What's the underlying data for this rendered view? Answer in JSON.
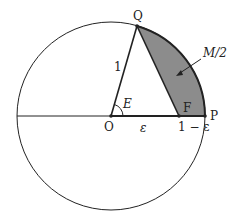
{
  "diagram": {
    "labels": {
      "Q": "Q",
      "O": "O",
      "F": "F",
      "P": "P",
      "E": "E",
      "one": "1",
      "eps": "ε",
      "one_minus_eps": "1 − ε",
      "area": "M/2"
    },
    "colors": {
      "stroke": "#222222",
      "shade": "#8c8c8c",
      "background": "#ffffff"
    }
  }
}
